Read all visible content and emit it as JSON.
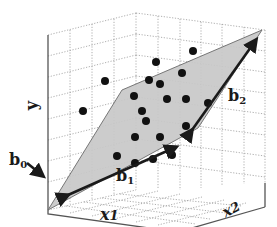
{
  "diagram": {
    "type": "3d-regression-plane",
    "labels": {
      "y_axis": "y",
      "x1_axis": "x",
      "x1_sub": "1",
      "x2_axis": "x",
      "x2_sub": "2",
      "b0": "b",
      "b0_sub": "0",
      "b1": "b",
      "b1_sub": "1",
      "b2": "b",
      "b2_sub": "2"
    },
    "colors": {
      "plane_fill": "#c8c8c8",
      "plane_edge": "#6a6a6a",
      "point": "#111111",
      "arrow": "#1a1a1a",
      "grid": "#9a9a9a",
      "frame": "#555555"
    },
    "plane_vertices": [
      [
        48,
        210
      ],
      [
        122,
        90
      ],
      [
        262,
        30
      ],
      [
        198,
        128
      ]
    ],
    "points": [
      [
        193,
        51
      ],
      [
        156,
        62
      ],
      [
        105,
        81
      ],
      [
        182,
        73
      ],
      [
        149,
        80
      ],
      [
        160,
        84
      ],
      [
        134,
        96
      ],
      [
        167,
        99
      ],
      [
        186,
        99
      ],
      [
        208,
        103
      ],
      [
        83,
        111
      ],
      [
        142,
        111
      ],
      [
        146,
        121
      ],
      [
        186,
        126
      ],
      [
        135,
        137
      ],
      [
        160,
        137
      ],
      [
        117,
        156
      ],
      [
        135,
        163
      ],
      [
        153,
        159
      ],
      [
        172,
        155
      ]
    ]
  }
}
